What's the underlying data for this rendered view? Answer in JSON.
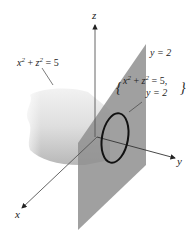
{
  "figure": {
    "axes": {
      "x": "x",
      "y": "y",
      "z": "z"
    },
    "labels": {
      "cylinder": {
        "base": "x",
        "exp": "2",
        "plus": "+",
        "base2": "z",
        "exp2": "2",
        "rhs": "= 5"
      },
      "plane": "y = 2",
      "intersection_line1": {
        "base": "x",
        "exp": "2",
        "plus": "+",
        "base2": "z",
        "exp2": "2",
        "rhs": "= 5,"
      },
      "intersection_line2": "y = 2"
    },
    "colors": {
      "plane": "#8f8f8f",
      "cylinder_light": "#e8e8e8",
      "cylinder_dark": "#bdbdbd",
      "axis": "#555555",
      "curve": "#111111"
    }
  }
}
